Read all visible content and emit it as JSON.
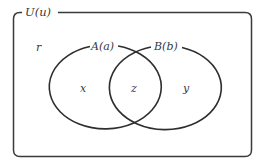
{
  "diagram": {
    "type": "venn",
    "universe": {
      "label": "U(u)"
    },
    "sets": [
      {
        "id": "A",
        "label": "A(a)"
      },
      {
        "id": "B",
        "label": "B(b)"
      }
    ],
    "regions": {
      "outside": "r",
      "only_A": "x",
      "A_and_B": "z",
      "only_B": "y"
    },
    "colors": {
      "stroke": "#2e2e2e",
      "text": "#3a3a3a",
      "background": "#ffffff"
    }
  }
}
